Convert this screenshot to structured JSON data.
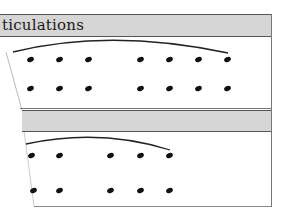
{
  "section1": {
    "title": "ticulations",
    "rows": [
      {
        "dots_x": [
          30,
          59,
          88,
          140,
          169,
          198,
          227
        ],
        "y": 59
      },
      {
        "dots_x": [
          30,
          59,
          88,
          140,
          169,
          198,
          227
        ],
        "y": 88
      }
    ]
  },
  "section2": {
    "title": "",
    "rows": [
      {
        "dots_x": [
          31,
          59,
          110,
          140,
          169
        ],
        "y": 155
      },
      {
        "dots_x": [
          33,
          59,
          110,
          140,
          169
        ],
        "y": 190
      }
    ]
  },
  "colors": {
    "band": "#d6d6d6",
    "border": "#555555",
    "ink": "#111111"
  }
}
